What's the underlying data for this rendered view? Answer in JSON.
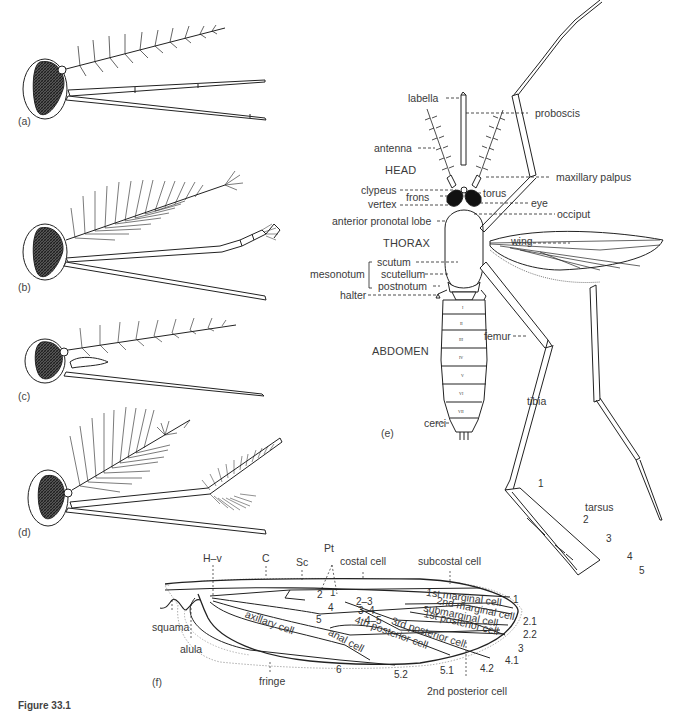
{
  "figure": {
    "caption": "Figure 33.1",
    "panels": [
      "(a)",
      "(b)",
      "(c)",
      "(d)",
      "(e)",
      "(f)"
    ]
  },
  "panel_e": {
    "regions": [
      "HEAD",
      "THORAX",
      "ABDOMEN"
    ],
    "labels_left": [
      "labella",
      "antenna",
      "clypeus",
      "frons",
      "vertex",
      "anterior pronotal lobe",
      "mesonotum",
      "scutum",
      "scutellum",
      "postnotum",
      "halter",
      "cerci"
    ],
    "labels_right": [
      "proboscis",
      "maxillary palpus",
      "torus",
      "eye",
      "occiput",
      "wing",
      "femur",
      "tibia",
      "tarsus"
    ],
    "tarsus_segments": [
      "1",
      "2",
      "3",
      "4",
      "5"
    ],
    "abdomen_segments": [
      "I",
      "II",
      "III",
      "IV",
      "V",
      "VI",
      "VII"
    ]
  },
  "panel_f": {
    "top_labels": [
      "H–v",
      "C",
      "Sc",
      "Pt",
      "costal cell",
      "subcostal cell"
    ],
    "left_labels": [
      "squama",
      "alula",
      "fringe"
    ],
    "cells": [
      "1st marginal cell",
      "2nd marginal cell",
      "submarginal cell",
      "1st posterior cell",
      "3rd posterior cell",
      "4th posterior cell",
      "anal cell",
      "axillary cell",
      "2nd posterior cell"
    ],
    "vein_numbers": [
      "2",
      "1",
      "4",
      "5",
      "2–3",
      "3–4",
      "4–5",
      "1",
      "2.1",
      "2.2",
      "3",
      "4.1",
      "4.2",
      "5.1",
      "5.2",
      "6"
    ]
  }
}
